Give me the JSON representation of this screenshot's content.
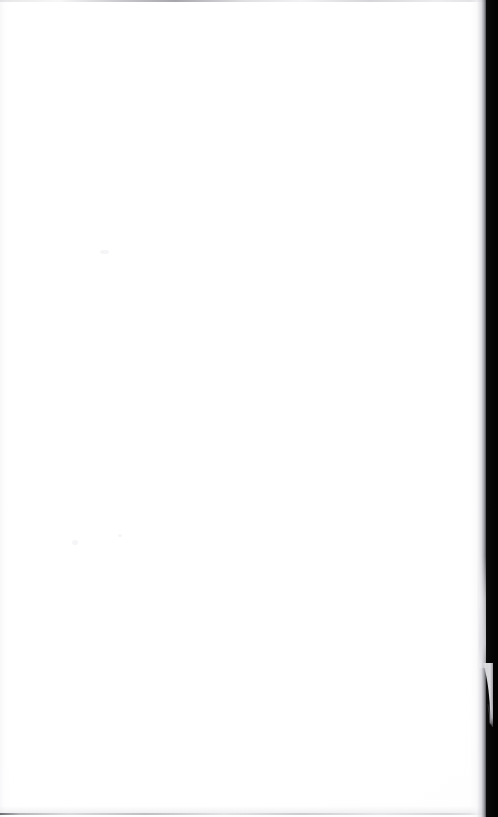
{
  "page": {
    "kind": "scanned-document-page",
    "content_description": "Blank page",
    "visible_text": "",
    "width_px": 498,
    "height_px": 817,
    "orientation": "portrait"
  },
  "colors": {
    "paper": "#ffffff",
    "paper_shade": "#fdfdfd",
    "gutter_band": "#050506",
    "top_rule": "#96969d",
    "bottom_rule": "#606066",
    "falloff_mid": "#d6d6dc",
    "curl_highlight": "#f2f2f5",
    "speck": "#f4f4f6"
  },
  "regions": {
    "paper_surface": {
      "name": "Blank paper surface",
      "left_px": 0,
      "top_px": 0,
      "width_px": 486,
      "height_px": 817
    },
    "top_edge": {
      "name": "Top edge rule",
      "top_px": 0,
      "height_px": 2
    },
    "bottom_edge": {
      "name": "Bottom edge rule",
      "bottom_px": 2,
      "height_px": 2
    },
    "left_edge": {
      "name": "Left edge tint",
      "left_px": 0,
      "width_px": 10
    },
    "right_falloff": {
      "name": "Right shadow falloff",
      "right_px": 12,
      "width_px": 16
    },
    "gutter_band": {
      "name": "Scanner gutter dark band",
      "right_px": 0,
      "width_px": 12,
      "height_px": 817
    },
    "page_curl": {
      "name": "Page curl highlight",
      "right_px": 5,
      "top_px": 663,
      "width_px": 13,
      "height_px": 64
    }
  },
  "artifacts": {
    "specks": [
      {
        "label": "speck-upper",
        "left_px": 100,
        "top_px": 250
      },
      {
        "label": "speck-mid-left",
        "left_px": 72,
        "top_px": 540
      },
      {
        "label": "speck-mid-right",
        "left_px": 118,
        "top_px": 534
      }
    ]
  },
  "accessibility": {
    "caption": "Blank scanned page: an empty white sheet with a dark scanner gutter along the right edge and a slight page curl near the lower right."
  }
}
